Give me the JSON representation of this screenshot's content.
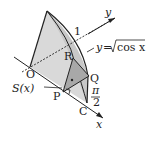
{
  "diagram": {
    "type": "solid-cross-section",
    "labels": {
      "origin": "O",
      "one": "1",
      "y_axis": "y",
      "x_axis": "x",
      "curve": "y=√cos x",
      "curve_lhs": "y",
      "curve_eq": "=",
      "curve_rhs": "cos x",
      "point_R": "R",
      "point_Q": "Q",
      "point_P": "P",
      "point_C": "C",
      "area": "S(x)",
      "pi": "π",
      "two": "2"
    },
    "colors": {
      "solid_fill": "#d9d9d9",
      "section_fill": "#a8a8a8",
      "line": "#222222",
      "background": "#ffffff"
    }
  }
}
